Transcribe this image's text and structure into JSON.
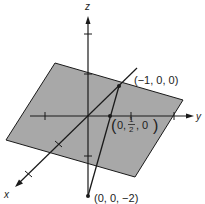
{
  "figure": {
    "type": "3d-axes-plane-diagram",
    "axes": {
      "x_label": "x",
      "y_label": "y",
      "z_label": "z"
    },
    "points": [
      {
        "name": "point-x-intercept",
        "label": "(−1, 0, 0)"
      },
      {
        "name": "point-y-intercept",
        "label_left": "(",
        "coord_prefix": "0,",
        "frac_num": "1",
        "frac_den": "2",
        "coord_suffix": ", 0",
        "label_right": ")"
      },
      {
        "name": "point-z-intercept",
        "label": "(0, 0, −2)"
      }
    ],
    "colors": {
      "plane_fill": "#a8a8a8",
      "line": "#1a1a1a",
      "background": "#ffffff"
    }
  }
}
